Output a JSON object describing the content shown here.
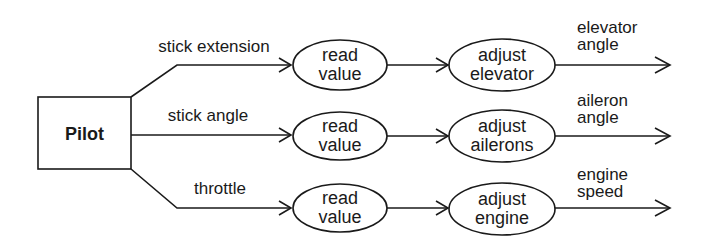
{
  "diagram": {
    "source_node": {
      "label": "Pilot"
    },
    "rows": [
      {
        "input_label": "stick extension",
        "read_node": {
          "line1": "read",
          "line2": "value"
        },
        "adjust_node": {
          "line1": "adjust",
          "line2": "elevator"
        },
        "output_label": {
          "line1": "elevator",
          "line2": "angle"
        }
      },
      {
        "input_label": "stick angle",
        "read_node": {
          "line1": "read",
          "line2": "value"
        },
        "adjust_node": {
          "line1": "adjust",
          "line2": "ailerons"
        },
        "output_label": {
          "line1": "aileron",
          "line2": "angle"
        }
      },
      {
        "input_label": "throttle",
        "read_node": {
          "line1": "read",
          "line2": "value"
        },
        "adjust_node": {
          "line1": "adjust",
          "line2": "engine"
        },
        "output_label": {
          "line1": "engine",
          "line2": "speed"
        }
      }
    ],
    "colors": {
      "ink": "#1a1a1a",
      "background": "#ffffff"
    }
  }
}
